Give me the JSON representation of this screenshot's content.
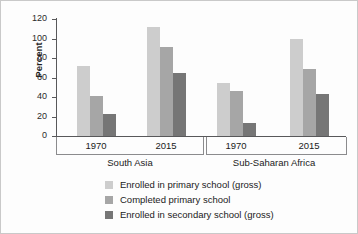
{
  "chart_data": {
    "type": "bar",
    "title": "",
    "xlabel": "",
    "ylabel": "Percent",
    "ylim": [
      0,
      120
    ],
    "yticks": [
      0,
      20,
      40,
      60,
      80,
      100,
      120
    ],
    "ytick_labels": [
      "0",
      "20",
      "40",
      "60",
      "80",
      "100",
      "120"
    ],
    "grid": false,
    "legend_position": "bottom",
    "groups": [
      {
        "name": "South Asia",
        "categories": [
          "1970",
          "2015"
        ]
      },
      {
        "name": "Sub-Saharan Africa",
        "categories": [
          "1970",
          "2015"
        ]
      }
    ],
    "categories": [
      "South Asia 1970",
      "South Asia 2015",
      "Sub-Saharan Africa 1970",
      "Sub-Saharan Africa 2015"
    ],
    "series": [
      {
        "name": "Enrolled in primary school (gross)",
        "color": "#cdcdcd",
        "values": [
          72,
          112,
          54,
          100
        ]
      },
      {
        "name": "Completed primary school",
        "color": "#a6a6a6",
        "values": [
          41,
          91,
          46,
          69
        ]
      },
      {
        "name": "Enrolled in secondary school (gross)",
        "color": "#767676",
        "values": [
          23,
          65,
          13,
          43
        ]
      }
    ]
  },
  "axis": {
    "y_title": "Percent"
  },
  "legend": {
    "items": [
      {
        "label": "Enrolled in primary school (gross)",
        "color": "#cdcdcd"
      },
      {
        "label": "Completed primary school",
        "color": "#a6a6a6"
      },
      {
        "label": "Enrolled in secondary school (gross)",
        "color": "#767676"
      }
    ]
  }
}
